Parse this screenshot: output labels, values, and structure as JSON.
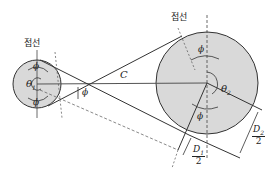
{
  "labels": {
    "tangent_left": "접선",
    "tangent_right": "접선",
    "theta1": "θ",
    "theta1_sub": "1",
    "theta2": "θ",
    "theta2_sub": "2",
    "center_distance": "C",
    "phi": "ϕ",
    "d1_num": "D",
    "d1_sub": "1",
    "d1_den": "2",
    "d2_num": "D",
    "d2_sub": "2",
    "d2_den": "2"
  },
  "colors": {
    "pulley_fill": "#d9d9d9",
    "line": "#333333"
  }
}
